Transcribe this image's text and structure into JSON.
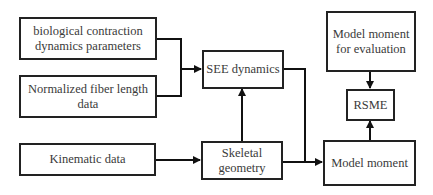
{
  "diagram": {
    "nodes": {
      "bio_params": {
        "label": "biological contraction dynamics parameters",
        "line1": "biological contraction",
        "line2": "dynamics parameters"
      },
      "fiber_length": {
        "label": "Normalized fiber length data",
        "line1": "Normalized fiber length",
        "line2": "data"
      },
      "kinematic": {
        "label": "Kinematic data"
      },
      "see_dynamics": {
        "label": "SEE dynamics"
      },
      "skeletal": {
        "label": "Skeletal geometry",
        "line1": "Skeletal",
        "line2": "geometry"
      },
      "eval_moment": {
        "label": "Model moment for evaluation",
        "line1": "Model moment",
        "line2": "for evaluation"
      },
      "rsme": {
        "label": "RSME"
      },
      "model_moment": {
        "label": "Model moment"
      }
    },
    "edges": [
      {
        "from": "biological contraction dynamics parameters",
        "to": "SEE dynamics"
      },
      {
        "from": "Normalized fiber length data",
        "to": "SEE dynamics"
      },
      {
        "from": "Kinematic data",
        "to": "Skeletal geometry"
      },
      {
        "from": "Skeletal geometry",
        "to": "SEE dynamics"
      },
      {
        "from": "SEE dynamics",
        "to": "Model moment"
      },
      {
        "from": "Skeletal geometry",
        "to": "Model moment"
      },
      {
        "from": "Model moment for evaluation",
        "to": "RSME"
      },
      {
        "from": "Model moment",
        "to": "RSME"
      }
    ]
  }
}
